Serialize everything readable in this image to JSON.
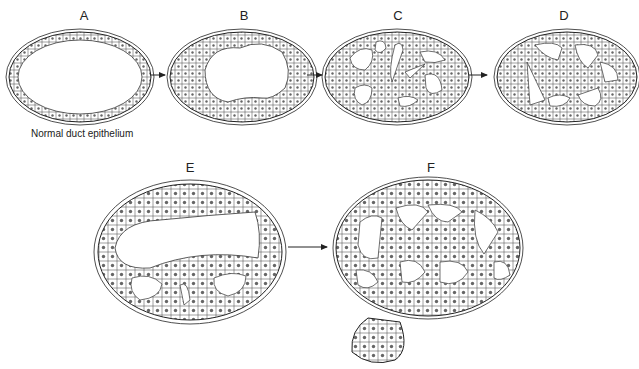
{
  "figure": {
    "panels": [
      {
        "id": "A",
        "label": "A",
        "caption": "Normal duct epithelium",
        "stage": "normal duct, single cell layer, open lumen"
      },
      {
        "id": "B",
        "label": "B",
        "stage": "epithelial hyperplasia, thickened wall"
      },
      {
        "id": "C",
        "label": "C",
        "stage": "proliferation with irregular spaces"
      },
      {
        "id": "D",
        "label": "D",
        "stage": "bridging cell cords, cribriform-like spaces"
      },
      {
        "id": "E",
        "label": "E",
        "stage": "cell bridges with partial lumina"
      },
      {
        "id": "F",
        "label": "F",
        "stage": "cribriform pattern with outpouching bud"
      }
    ],
    "arrows": [
      {
        "from": "A",
        "to": "B"
      },
      {
        "from": "B",
        "to": "C"
      },
      {
        "from": "C",
        "to": "D"
      },
      {
        "from": "E",
        "to": "F"
      }
    ],
    "colors": {
      "line": "#222222",
      "background": "#ffffff",
      "nucleus": "#555555"
    }
  }
}
